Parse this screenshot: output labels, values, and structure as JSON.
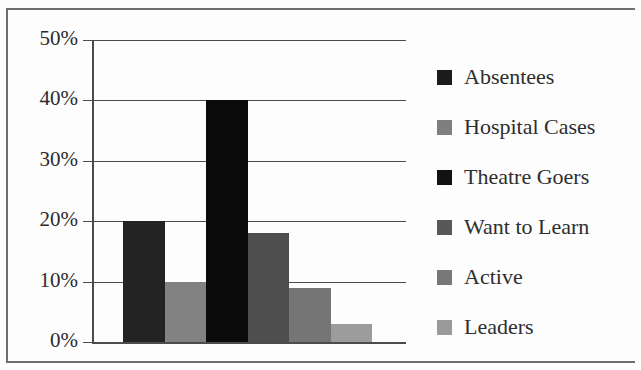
{
  "chart_data": {
    "type": "bar",
    "title": "",
    "subtitle": "",
    "xlabel": "",
    "ylabel": "",
    "categories": [
      "Absentees",
      "Hospital Cases",
      "Theatre Goers",
      "Want to Learn",
      "Active",
      "Leaders"
    ],
    "values": [
      20,
      10,
      40,
      18,
      9,
      3
    ],
    "value_unit": "%",
    "ylim": [
      0,
      50
    ],
    "ytick_labels": [
      "50%",
      "40%",
      "30%",
      "20%",
      "10%",
      "0%"
    ],
    "ytick_values": [
      50,
      40,
      30,
      20,
      10,
      0
    ],
    "grid": true,
    "grid_axis": "y",
    "xtick_labels": [],
    "legend_position": "right",
    "series": [
      {
        "name": "Absentees",
        "value": 20,
        "color": "#232323"
      },
      {
        "name": "Hospital Cases",
        "value": 10,
        "color": "#828282"
      },
      {
        "name": "Theatre Goers",
        "value": 40,
        "color": "#0b0b0b"
      },
      {
        "name": "Want to Learn",
        "value": 18,
        "color": "#4e4e4e"
      },
      {
        "name": "Active",
        "value": 9,
        "color": "#757575"
      },
      {
        "name": "Leaders",
        "value": 3,
        "color": "#9c9c9c"
      }
    ],
    "legend": [
      {
        "label": "Absentees",
        "color": "#1c1c1c"
      },
      {
        "label": "Hospital Cases",
        "color": "#7f7f7f"
      },
      {
        "label": "Theatre Goers",
        "color": "#121212"
      },
      {
        "label": "Want to Learn",
        "color": "#585858"
      },
      {
        "label": "Active",
        "color": "#787878"
      },
      {
        "label": "Leaders",
        "color": "#9a9a9a"
      }
    ]
  },
  "style": {
    "background": "#fdfdfd",
    "axis_color": "#4c4c4c",
    "frame_color": "#6e6e6e",
    "text_color": "#2b2b2b"
  }
}
